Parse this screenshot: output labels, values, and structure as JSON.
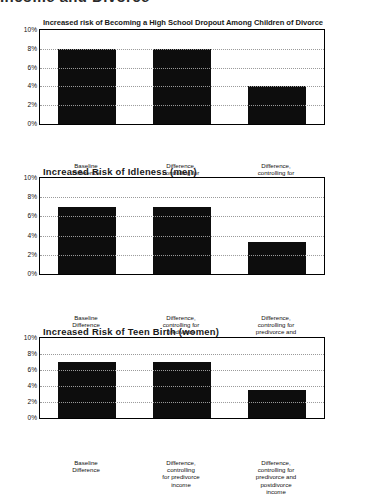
{
  "page": {
    "heading": "Income and Divorce"
  },
  "chart_data": [
    {
      "id": "chart-1",
      "type": "bar",
      "title": "Increased risk of Becoming a High School Dropout Among Children of Divorce",
      "xlabel": "",
      "ylabel": "",
      "ylim": [
        0,
        10
      ],
      "grid": true,
      "legend": "none",
      "yticks": [
        "0%",
        "2%",
        "4%",
        "6%",
        "8%",
        "10%"
      ],
      "ytick_values": [
        0,
        2,
        4,
        6,
        8,
        10
      ],
      "categories": [
        [
          "Baseline",
          "Difference"
        ],
        [
          "Difference,",
          "controlling for",
          "predivorce",
          "income"
        ],
        [
          "Difference,",
          "controlling for",
          "predivorce and",
          "postdivorce",
          "income"
        ]
      ],
      "values": [
        8.0,
        8.0,
        4.0
      ]
    },
    {
      "id": "chart-2",
      "type": "bar",
      "title": "Increased Risk of Idleness (men)",
      "xlabel": "",
      "ylabel": "",
      "ylim": [
        0,
        10
      ],
      "grid": true,
      "legend": "none",
      "yticks": [
        "0%",
        "2%",
        "4%",
        "6%",
        "8%",
        "10%"
      ],
      "ytick_values": [
        0,
        2,
        4,
        6,
        8,
        10
      ],
      "categories": [
        [
          "Baseline",
          "Difference"
        ],
        [
          "Difference,",
          "controlling for",
          "predivorce",
          "income"
        ],
        [
          "Difference,",
          "controlling for",
          "predivorce and",
          "postdivorce",
          "income"
        ]
      ],
      "values": [
        7.0,
        7.0,
        3.3
      ]
    },
    {
      "id": "chart-3",
      "type": "bar",
      "title": "Increased Risk of Teen Birth (women)",
      "xlabel": "",
      "ylabel": "",
      "ylim": [
        0,
        10
      ],
      "grid": true,
      "legend": "none",
      "yticks": [
        "0%",
        "2%",
        "4%",
        "6%",
        "8%",
        "10%"
      ],
      "ytick_values": [
        0,
        2,
        4,
        6,
        8,
        10
      ],
      "categories": [
        [
          "Baseline",
          "Difference"
        ],
        [
          "Difference,",
          "controlling",
          "for predivorce",
          "income"
        ],
        [
          "Difference,",
          "controlling for",
          "predivorce and",
          "postdivorce",
          "income"
        ]
      ],
      "values": [
        7.0,
        7.0,
        3.5
      ]
    }
  ]
}
